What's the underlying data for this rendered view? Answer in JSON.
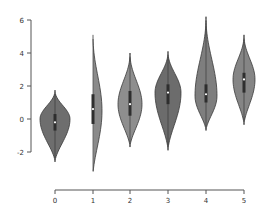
{
  "chart_data": {
    "type": "violin",
    "title": "",
    "xlabel": "",
    "ylabel": "",
    "categories": [
      "0",
      "1",
      "2",
      "3",
      "4",
      "5"
    ],
    "ylim": [
      -2,
      6
    ],
    "yticks": [
      "6",
      "4",
      "2",
      "0",
      "-2"
    ],
    "xticks": [
      "0",
      "1",
      "2",
      "3",
      "4",
      "5"
    ],
    "grid": false,
    "legend": null,
    "violins": [
      {
        "category": "0",
        "min": -2.6,
        "max": 1.75,
        "median": -0.2,
        "q1": -0.7,
        "q3": 0.3,
        "mode": 0.0,
        "color": "#6e6e6e"
      },
      {
        "category": "1",
        "min": -3.4,
        "max": 5.1,
        "median": 0.6,
        "q1": -0.3,
        "q3": 1.5,
        "mode": 0.5,
        "color": "#8a8a8a"
      },
      {
        "category": "2",
        "min": -1.7,
        "max": 4.0,
        "median": 0.9,
        "q1": 0.2,
        "q3": 1.7,
        "mode": 0.9,
        "color": "#8e8e8e"
      },
      {
        "category": "3",
        "min": -1.9,
        "max": 4.1,
        "median": 1.6,
        "q1": 0.9,
        "q3": 2.1,
        "mode": 1.6,
        "color": "#6c6c6c"
      },
      {
        "category": "4",
        "min": -0.7,
        "max": 6.2,
        "median": 1.5,
        "q1": 1.0,
        "q3": 2.1,
        "mode": 1.4,
        "color": "#7e7e7e"
      },
      {
        "category": "5",
        "min": -0.35,
        "max": 5.1,
        "median": 2.4,
        "q1": 1.6,
        "q3": 2.8,
        "mode": 2.4,
        "color": "#858585"
      }
    ]
  },
  "axes": {
    "y": {
      "ticks": [
        "6",
        "4",
        "2",
        "0",
        "-2"
      ]
    },
    "x": {
      "ticks": [
        "0",
        "1",
        "2",
        "3",
        "4",
        "5"
      ]
    }
  }
}
